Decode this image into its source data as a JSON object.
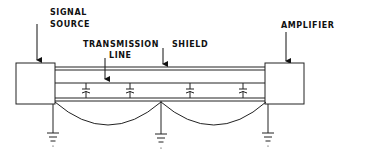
{
  "diagram": {
    "labels": {
      "signal_source_line1": "SIGNAL",
      "signal_source_line2": "SOURCE",
      "transmission_line_line1": "TRANSMISSION",
      "transmission_line_line2": "LINE",
      "shield": "SHIELD",
      "amplifier": "AMPLIFIER"
    },
    "components": [
      "signal-source-box",
      "amplifier-box",
      "shield",
      "transmission-line",
      "stray-capacitors",
      "ground-symbols",
      "ground-loop-arcs"
    ],
    "capacitor_count": 4,
    "ground_count": 3,
    "colors": {
      "line": "#222222",
      "background": "#ffffff"
    }
  }
}
